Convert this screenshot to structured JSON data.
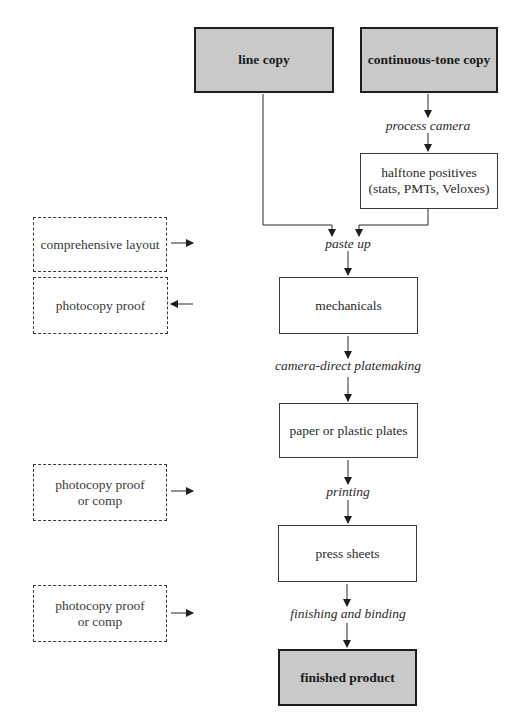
{
  "diagram": {
    "type": "flowchart",
    "title": "",
    "source_boxes": [
      {
        "id": "line_copy",
        "label": "line copy",
        "style": "shaded"
      },
      {
        "id": "continuous_tone_copy",
        "label": "continuous-tone copy",
        "style": "shaded"
      }
    ],
    "process_boxes": [
      {
        "id": "halftone_positives",
        "line1": "halftone positives",
        "line2": "(stats, PMTs, Veloxes)",
        "style": "solid"
      },
      {
        "id": "mechanicals",
        "label": "mechanicals",
        "style": "solid"
      },
      {
        "id": "plates",
        "label": "paper or plastic plates",
        "style": "solid"
      },
      {
        "id": "press_sheets",
        "label": "press sheets",
        "style": "solid"
      },
      {
        "id": "finished_product",
        "label": "finished product",
        "style": "shaded"
      }
    ],
    "steps": [
      {
        "id": "process_camera",
        "label": "process camera"
      },
      {
        "id": "paste_up",
        "label": "paste up"
      },
      {
        "id": "camera_direct",
        "label": "camera-direct platemaking"
      },
      {
        "id": "printing",
        "label": "printing"
      },
      {
        "id": "finishing",
        "label": "finishing and binding"
      }
    ],
    "proof_boxes": [
      {
        "id": "comprehensive_layout",
        "line1": "comprehensive layout",
        "line2": "",
        "arrow": "right",
        "style": "dashed"
      },
      {
        "id": "photocopy_proof",
        "line1": "photocopy proof",
        "line2": "",
        "arrow": "left",
        "style": "dashed"
      },
      {
        "id": "proof_or_comp_1",
        "line1": "photocopy proof",
        "line2": "or comp",
        "arrow": "right",
        "style": "dashed"
      },
      {
        "id": "proof_or_comp_2",
        "line1": "photocopy proof",
        "line2": "or comp",
        "arrow": "right",
        "style": "dashed"
      }
    ],
    "colors": {
      "shaded_fill": "#c9c9c9",
      "line": "#2a2a2a",
      "background": "#ffffff"
    }
  }
}
